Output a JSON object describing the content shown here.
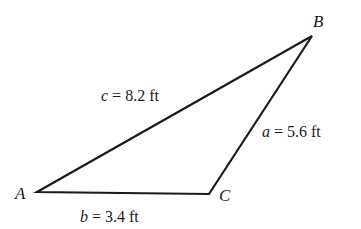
{
  "diagram": {
    "type": "triangle",
    "stroke_color": "#1a1a1a",
    "vertices": [
      {
        "id": "A",
        "label": "A",
        "x": 37,
        "y": 192
      },
      {
        "id": "B",
        "label": "B",
        "x": 312,
        "y": 36
      },
      {
        "id": "C",
        "label": "C",
        "x": 209,
        "y": 194
      }
    ],
    "sides": [
      {
        "id": "a",
        "variable": "a",
        "equals": " = ",
        "value": "5.6 ft",
        "between": [
          "B",
          "C"
        ]
      },
      {
        "id": "b",
        "variable": "b",
        "equals": " = ",
        "value": "3.4 ft",
        "between": [
          "A",
          "C"
        ]
      },
      {
        "id": "c",
        "variable": "c",
        "equals": " = ",
        "value": "8.2 ft",
        "between": [
          "A",
          "B"
        ]
      }
    ]
  }
}
